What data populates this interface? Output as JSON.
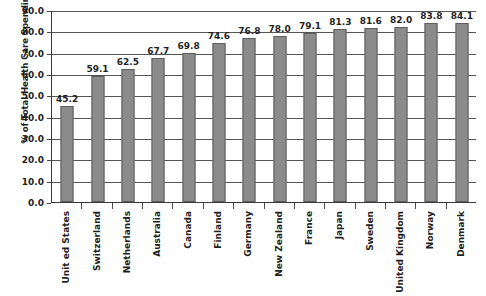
{
  "chart_data": {
    "type": "bar",
    "title": "",
    "subtitle": "",
    "xlabel": "",
    "ylabel": "% of Total Health Care Spending",
    "ylim": [
      0.0,
      90.0
    ],
    "ytick_step": 10.0,
    "ytick_labels": [
      "0.0",
      "10.0",
      "20.0",
      "30.0",
      "40.0",
      "50.0",
      "60.0",
      "70.0",
      "80.0",
      "90.0"
    ],
    "grid": "horizontal",
    "legend": "none",
    "bar_color": "#8b8b8b",
    "bar_edge_color": "#5d5d5d",
    "gridline_color": "#555555",
    "axis_color": "#3a3a3a",
    "text_color": "#1f1f1f",
    "background_color": "#ffffff",
    "categories": [
      "Unit ed States",
      "Switzerland",
      "Netherlands",
      "Australia",
      "Canada",
      "Finland",
      "Germany",
      "New Zealand",
      "France",
      "Japan",
      "Sweden",
      "United Kingdom",
      "Norway",
      "Denmark"
    ],
    "values": [
      45.2,
      59.1,
      62.5,
      67.7,
      69.8,
      74.6,
      76.8,
      78.0,
      79.1,
      81.3,
      81.6,
      82.0,
      83.8,
      84.1
    ],
    "value_labels": [
      "45.2",
      "59.1",
      "62.5",
      "67.7",
      "69.8",
      "74.6",
      "76.8",
      "78.0",
      "79.1",
      "81.3",
      "81.6",
      "82.0",
      "83.8",
      "84.1"
    ]
  }
}
